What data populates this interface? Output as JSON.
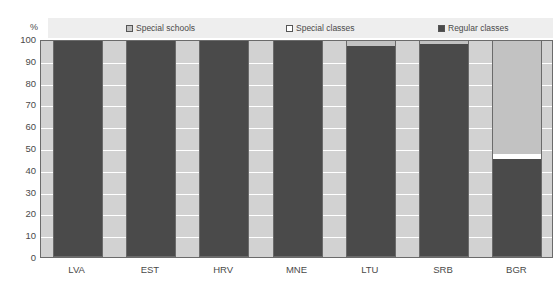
{
  "chart_data": {
    "type": "bar",
    "subtype": "stacked-percentage-column",
    "title": "",
    "xlabel": "",
    "ylabel": "%",
    "ylim": [
      0,
      100
    ],
    "yticks": [
      0,
      10,
      20,
      30,
      40,
      50,
      60,
      70,
      80,
      90,
      100
    ],
    "ytick_labels": [
      "0",
      "10",
      "20",
      "30",
      "40",
      "50",
      "60",
      "70",
      "80",
      "90",
      "100"
    ],
    "grid": true,
    "legend_position": "top",
    "categories": [
      "LVA",
      "EST",
      "HRV",
      "MNE",
      "LTU",
      "SRB",
      "BGR"
    ],
    "series": [
      {
        "name": "Special schools",
        "color": "#c2c2c2",
        "values": [
          0,
          0,
          0,
          0,
          3,
          2,
          53
        ]
      },
      {
        "name": "Special classes",
        "color": "#ffffff",
        "values": [
          0,
          0,
          0,
          0,
          0,
          0,
          2
        ]
      },
      {
        "name": "Regular classes",
        "color": "#4a4a4a",
        "values": [
          100,
          100,
          100,
          100,
          97,
          98,
          45
        ]
      }
    ]
  },
  "legend": {
    "items": [
      {
        "label": "Special schools",
        "color": "#c2c2c2"
      },
      {
        "label": "Special classes",
        "color": "#ffffff"
      },
      {
        "label": "Regular classes",
        "color": "#4a4a4a"
      }
    ]
  },
  "axes": {
    "y_unit": "%",
    "y_labels": [
      "100",
      "90",
      "80",
      "70",
      "60",
      "50",
      "40",
      "30",
      "20",
      "10",
      "0"
    ],
    "x_labels": [
      "LVA",
      "EST",
      "HRV",
      "MNE",
      "LTU",
      "SRB",
      "BGR"
    ]
  }
}
